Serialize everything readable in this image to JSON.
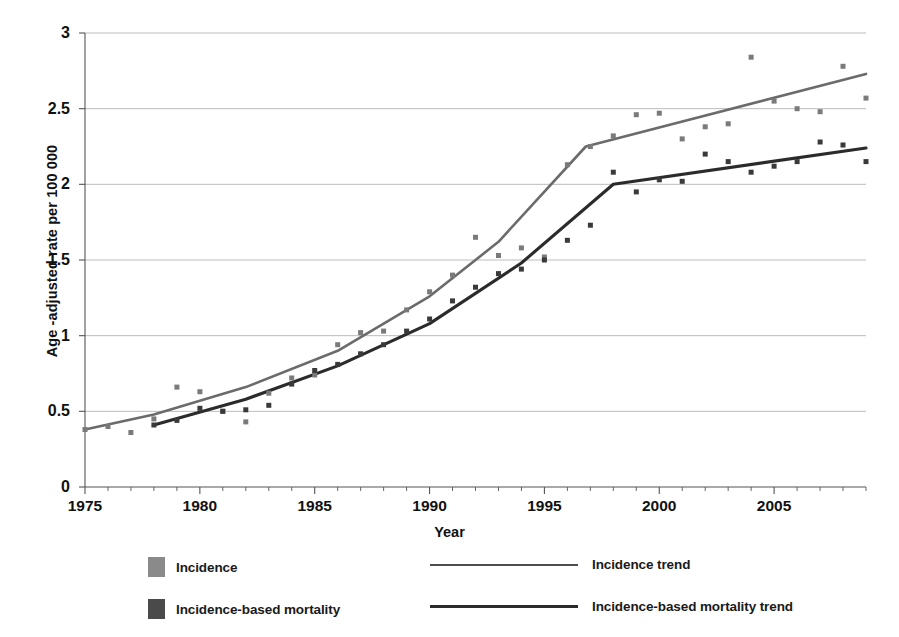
{
  "chart_data": {
    "type": "scatter",
    "title": "",
    "xlabel": "Year",
    "ylabel": "Age -adjusted rate per 100 000",
    "xlim": [
      1975,
      2009
    ],
    "ylim": [
      0,
      3
    ],
    "xticks": [
      1975,
      1980,
      1985,
      1990,
      1995,
      2000,
      2005
    ],
    "yticks": [
      "0",
      "0.5",
      "1",
      "1.5",
      "2",
      "2.5",
      "3"
    ],
    "grid": "horizontal",
    "legend_position": "bottom",
    "colors": {
      "incidence": "#7a7a7a",
      "incidence_trend": "#6b6b6b",
      "mortality": "#3a3a3a",
      "mortality_trend": "#2b2b2b",
      "gridline": "#b4b4b4",
      "axis": "#555555"
    },
    "series": [
      {
        "name": "Incidence",
        "marker": "square",
        "x": [
          1975,
          1976,
          1977,
          1978,
          1979,
          1980,
          1981,
          1982,
          1983,
          1984,
          1985,
          1986,
          1987,
          1988,
          1989,
          1990,
          1991,
          1992,
          1993,
          1994,
          1995,
          1996,
          1997,
          1998,
          1999,
          2000,
          2001,
          2002,
          2003,
          2004,
          2005,
          2006,
          2007,
          2008,
          2009
        ],
        "y": [
          0.38,
          0.4,
          0.36,
          0.45,
          0.66,
          0.63,
          0.5,
          0.43,
          0.62,
          0.72,
          0.74,
          0.94,
          1.02,
          1.03,
          1.17,
          1.29,
          1.4,
          1.65,
          1.53,
          1.58,
          1.52,
          2.13,
          2.25,
          2.32,
          2.46,
          2.47,
          2.3,
          2.38,
          2.4,
          2.84,
          2.55,
          2.5,
          2.48,
          2.78,
          2.57
        ]
      },
      {
        "name": "Incidence-based mortality",
        "marker": "square",
        "x": [
          1978,
          1979,
          1980,
          1981,
          1982,
          1983,
          1984,
          1985,
          1986,
          1987,
          1988,
          1989,
          1990,
          1991,
          1992,
          1993,
          1994,
          1995,
          1996,
          1997,
          1998,
          1999,
          2000,
          2001,
          2002,
          2003,
          2004,
          2005,
          2006,
          2007,
          2008,
          2009
        ],
        "y": [
          0.41,
          0.44,
          0.52,
          0.5,
          0.51,
          0.54,
          0.68,
          0.77,
          0.81,
          0.88,
          0.94,
          1.03,
          1.11,
          1.23,
          1.32,
          1.41,
          1.44,
          1.5,
          1.63,
          1.73,
          2.08,
          1.95,
          2.03,
          2.02,
          2.2,
          2.15,
          2.08,
          2.12,
          2.15,
          2.28,
          2.26,
          2.15
        ]
      }
    ],
    "trends": [
      {
        "name": "Incidence trend",
        "points": [
          [
            1975,
            0.38
          ],
          [
            1978,
            0.48
          ],
          [
            1982,
            0.66
          ],
          [
            1986,
            0.9
          ],
          [
            1990,
            1.26
          ],
          [
            1993,
            1.62
          ],
          [
            1996.8,
            2.25
          ],
          [
            2009,
            2.73
          ]
        ]
      },
      {
        "name": "Incidence-based mortality trend",
        "points": [
          [
            1978,
            0.41
          ],
          [
            1982,
            0.58
          ],
          [
            1986,
            0.8
          ],
          [
            1990,
            1.08
          ],
          [
            1994,
            1.48
          ],
          [
            1998,
            2.0
          ],
          [
            2009,
            2.24
          ]
        ]
      }
    ]
  },
  "legend": {
    "items": [
      {
        "label": "Incidence",
        "type": "swatch",
        "color": "#8a8a8a"
      },
      {
        "label": "Incidence trend",
        "type": "line",
        "color": "#4d4d4d"
      },
      {
        "label": "Incidence-based mortality",
        "type": "swatch",
        "color": "#4a4a4a"
      },
      {
        "label": "Incidence-based mortality trend",
        "type": "line",
        "color": "#2b2b2b"
      }
    ]
  }
}
